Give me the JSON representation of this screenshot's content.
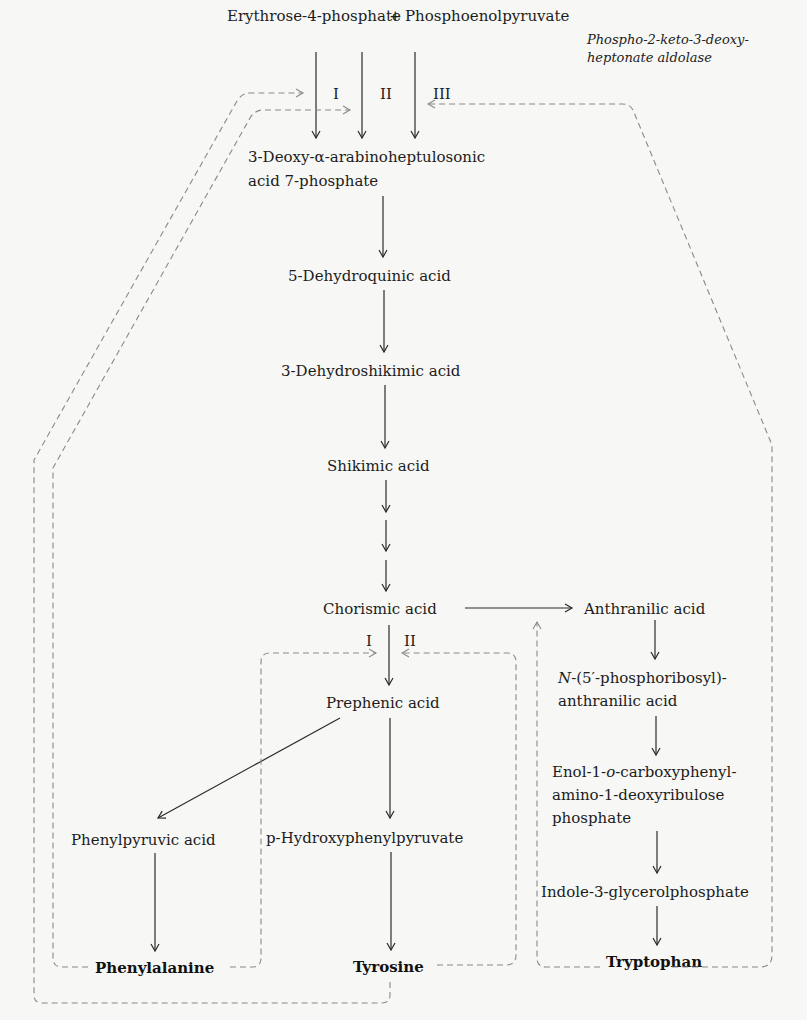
{
  "diagram": {
    "title_substrates": {
      "left": "Erythrose-4-phosphate",
      "plus": "+",
      "right": "Phosphoenolpyruvate"
    },
    "enzyme_label": {
      "line1": "Phospho-2-keto-3-deoxy-",
      "line2": "heptonate aldolase"
    },
    "isozymes_top": [
      "I",
      "II",
      "III"
    ],
    "isozymes_chorismate": [
      "I",
      "II"
    ],
    "main_pathway": [
      {
        "id": "dahp",
        "line1": "3-Deoxy-α-arabinoheptulosonic",
        "line2": "acid 7-phosphate"
      },
      {
        "id": "dhq",
        "label": "5-Dehydroquinic acid"
      },
      {
        "id": "dhs",
        "label": "3-Dehydroshikimic acid"
      },
      {
        "id": "shikimate",
        "label": "Shikimic acid"
      },
      {
        "id": "chorismate",
        "label": "Chorismic acid"
      },
      {
        "id": "prephenate",
        "label": "Prephenic acid"
      }
    ],
    "phe_branch": {
      "intermediate": "Phenylpyruvic acid",
      "product": "Phenylalanine"
    },
    "tyr_branch": {
      "intermediate": "p-Hydroxyphenylpyruvate",
      "product": "Tyrosine"
    },
    "trp_branch": {
      "anthranilate": "Anthranilic acid",
      "pra_prefix": "N",
      "pra_line1": "-(5′-phosphoribosyl)-",
      "pra_line2": "anthranilic acid",
      "cdrp_line1a": "Enol-1-",
      "cdrp_line1b": "o",
      "cdrp_line1c": "-carboxyphenyl-",
      "cdrp_line2": "amino-1-deoxyribulose",
      "cdrp_line3": "phosphate",
      "igp": "Indole-3-glycerolphosphate",
      "product": "Tryptophan"
    },
    "colors": {
      "text": "#1c1c1c",
      "solid_arrow": "#2a2a2a",
      "feedback_dashed": "#8a8a8a",
      "background": "#f7f7f5"
    }
  }
}
